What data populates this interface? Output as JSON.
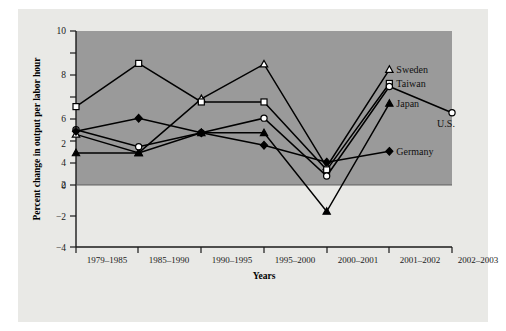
{
  "chart_data": {
    "type": "line",
    "title": "",
    "xlabel": "Years",
    "ylabel": "Percent change in output per labor hour",
    "categories": [
      "1979–1985",
      "1985–1990",
      "1990–1995",
      "1995–2000",
      "2000–2001",
      "2001–2002",
      "2002–2003"
    ],
    "ylim": [
      -4,
      10
    ],
    "yticks": [
      -4,
      -2,
      0,
      2,
      4,
      6,
      8,
      10
    ],
    "yticklabels": [
      "−4",
      "−2",
      "0",
      "2",
      "4",
      "6",
      "8",
      "10"
    ],
    "grid": false,
    "legend_position": "inline-right",
    "shaded_region": {
      "from": 0,
      "to": 10,
      "color": "#9a9a9a",
      "note": "positive region shaded dark gray"
    },
    "series": [
      {
        "name": "Sweden",
        "marker": "open-triangle",
        "values": [
          3.3,
          2.1,
          5.6,
          7.85,
          1.2,
          7.5,
          null
        ]
      },
      {
        "name": "Taiwan",
        "marker": "open-square",
        "values": [
          5.1,
          7.9,
          5.4,
          5.4,
          1.0,
          6.6,
          null
        ]
      },
      {
        "name": "Japan",
        "marker": "filled-triangle",
        "values": [
          2.1,
          2.1,
          3.4,
          3.4,
          -1.7,
          5.3,
          null
        ]
      },
      {
        "name": "U.S.",
        "marker": "open-circle",
        "values": [
          3.6,
          2.5,
          3.4,
          4.35,
          0.6,
          6.4,
          4.7
        ]
      },
      {
        "name": "Germany",
        "marker": "filled-diamond",
        "values": [
          3.5,
          4.35,
          3.4,
          2.6,
          1.5,
          2.2,
          null
        ]
      }
    ]
  },
  "labels": {
    "sweden": "Sweden",
    "taiwan": "Taiwan",
    "japan": "Japan",
    "us": "U.S.",
    "germany": "Germany"
  },
  "axis": {
    "y_title": "Percent change in output per labor hour",
    "x_title": "Years"
  },
  "yticklabels": {
    "t0": "10",
    "t1": "8",
    "t2": "6",
    "t3": "4",
    "t4": "2",
    "t5": "0",
    "t6": "−2",
    "t7": "−4"
  },
  "xticklabels": {
    "c0": "1979–1985",
    "c1": "1985–1990",
    "c2": "1990–1995",
    "c3": "1995–2000",
    "c4": "2000–2001",
    "c5": "2001–2002",
    "c6": "2002–2003"
  },
  "colors": {
    "page": "#ffffff",
    "card": "#e9e9e6",
    "shade": "#9a9a9a",
    "ink": "#000000"
  }
}
